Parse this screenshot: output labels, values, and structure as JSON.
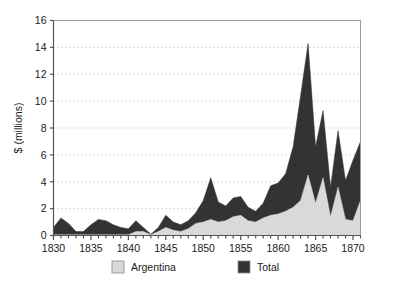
{
  "chart_data": {
    "type": "area",
    "title": "",
    "subtitle": "",
    "xlabel": "",
    "ylabel": "$ (millions)",
    "xlim": [
      1830,
      1871
    ],
    "ylim": [
      0,
      16
    ],
    "grid": true,
    "grid_axis": "y",
    "legend_position": "bottom",
    "stacked": false,
    "overlaid": true,
    "x": [
      1830,
      1831,
      1832,
      1833,
      1834,
      1835,
      1836,
      1837,
      1838,
      1839,
      1840,
      1841,
      1842,
      1843,
      1844,
      1845,
      1846,
      1847,
      1848,
      1849,
      1850,
      1851,
      1852,
      1853,
      1854,
      1855,
      1856,
      1857,
      1858,
      1859,
      1860,
      1861,
      1862,
      1863,
      1864,
      1865,
      1866,
      1867,
      1868,
      1869,
      1870,
      1871
    ],
    "series": [
      {
        "name": "Total",
        "color": "#333333",
        "values": [
          0.6,
          1.3,
          0.9,
          0.3,
          0.3,
          0.8,
          1.2,
          1.1,
          0.8,
          0.6,
          0.5,
          1.1,
          0.6,
          0.1,
          0.6,
          1.5,
          1.0,
          0.8,
          1.1,
          1.7,
          2.6,
          4.3,
          2.5,
          2.2,
          2.8,
          2.9,
          2.1,
          1.8,
          2.4,
          3.7,
          3.9,
          4.6,
          6.6,
          10.4,
          14.3,
          6.6,
          9.3,
          3.6,
          7.8,
          4.1,
          5.6,
          7.0
        ]
      },
      {
        "name": "Argentina",
        "color": "#d9d9d9",
        "values": [
          0.05,
          0.05,
          0.05,
          0.05,
          0.05,
          0.05,
          0.05,
          0.05,
          0.05,
          0.05,
          0.05,
          0.3,
          0.3,
          0.05,
          0.3,
          0.6,
          0.4,
          0.3,
          0.5,
          0.9,
          1.0,
          1.2,
          1.0,
          1.1,
          1.4,
          1.5,
          1.1,
          1.0,
          1.3,
          1.5,
          1.6,
          1.8,
          2.1,
          2.6,
          4.5,
          2.4,
          4.3,
          1.4,
          3.6,
          1.2,
          1.1,
          2.6
        ]
      }
    ],
    "y_ticks": [
      0,
      2,
      4,
      6,
      8,
      10,
      12,
      14,
      16
    ],
    "y_tick_labels": [
      "0",
      "2",
      "4",
      "6",
      "8",
      "10",
      "12",
      "14",
      "16"
    ],
    "x_ticks": [
      1830,
      1835,
      1840,
      1845,
      1850,
      1855,
      1860,
      1865,
      1870
    ],
    "x_tick_labels": [
      "1830",
      "1835",
      "1840",
      "1845",
      "1850",
      "1855",
      "1860",
      "1865",
      "1870"
    ],
    "x_minor_tick_step": 1
  },
  "legend": {
    "entries": [
      {
        "label": "Argentina",
        "color": "#d9d9d9"
      },
      {
        "label": "Total",
        "color": "#333333"
      }
    ]
  },
  "colors": {
    "argentina": "#d9d9d9",
    "total": "#333333",
    "axis": "#555555",
    "grid": "#cccccc",
    "background": "#ffffff"
  }
}
